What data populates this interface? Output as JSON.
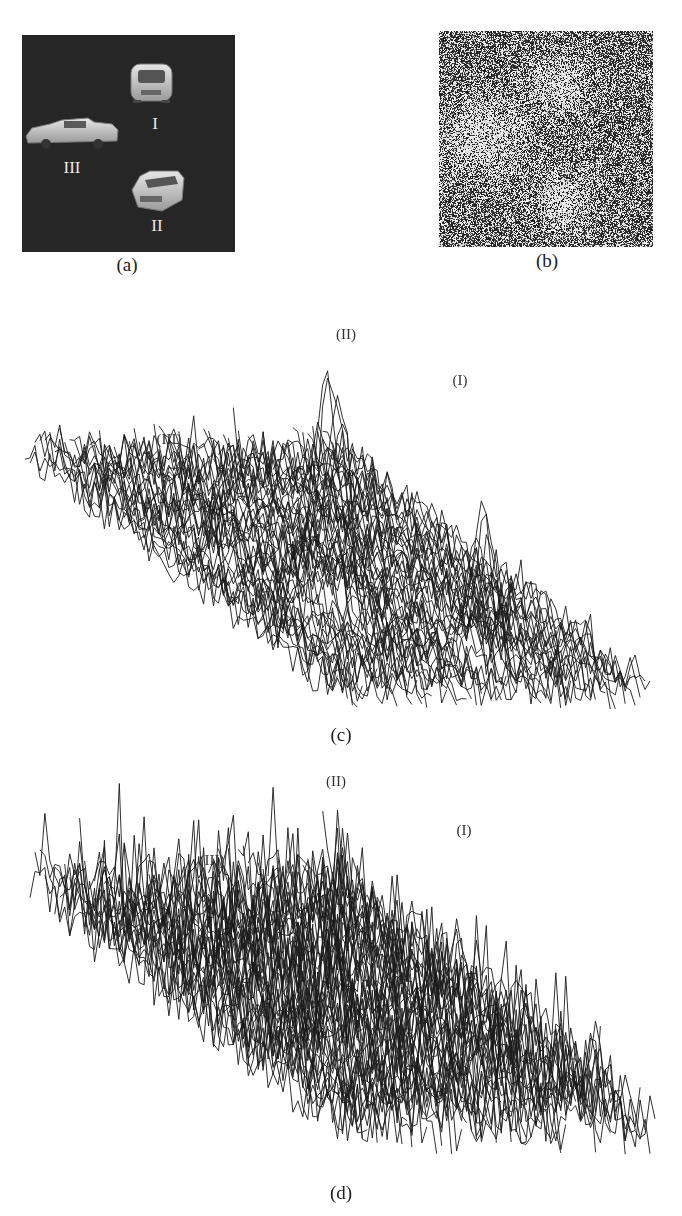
{
  "figure": {
    "panels": [
      {
        "id": "a",
        "caption": "(a)",
        "type": "input-scene-image",
        "background_color": "#262626",
        "objects": [
          {
            "label": "I",
            "kind": "car-front-view"
          },
          {
            "label": "II",
            "kind": "car-three-quarter-view"
          },
          {
            "label": "III",
            "kind": "car-side-view"
          }
        ]
      },
      {
        "id": "b",
        "caption": "(b)",
        "type": "noisy-image"
      },
      {
        "id": "c",
        "caption": "(c)",
        "type": "3d-correlation-surface",
        "peak_labels": [
          "(II)",
          "(I)",
          "(III)"
        ]
      },
      {
        "id": "d",
        "caption": "(d)",
        "type": "3d-correlation-surface",
        "peak_labels": [
          "(II)",
          "(I)",
          "(III)"
        ]
      }
    ]
  },
  "chart_data": [
    {
      "type": "surface",
      "title": "(c)",
      "peaks": [
        {
          "label": "(II)",
          "relative_height": 1.0
        },
        {
          "label": "(I)",
          "relative_height": 0.72
        },
        {
          "label": "(III)",
          "relative_height": 0.55
        }
      ],
      "noise_floor_relative": 0.35,
      "grid": false
    },
    {
      "type": "surface",
      "title": "(d)",
      "peaks": [
        {
          "label": "(II)",
          "relative_height": 1.0
        },
        {
          "label": "(I)",
          "relative_height": 0.68
        },
        {
          "label": "(III)",
          "relative_height": 0.5
        }
      ],
      "noise_floor_relative": 0.5,
      "grid": false
    }
  ]
}
